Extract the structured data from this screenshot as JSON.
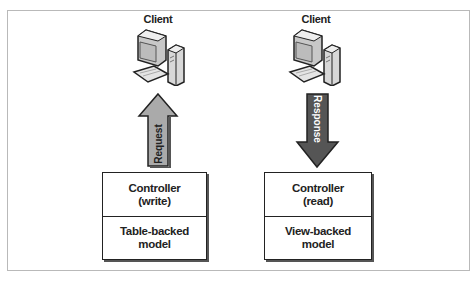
{
  "clients": [
    {
      "label": "Client",
      "icon": "desktop-computer-icon"
    },
    {
      "label": "Client",
      "icon": "desktop-computer-icon"
    }
  ],
  "arrows": [
    {
      "label": "Request",
      "direction": "up",
      "fill": "#aaaaaa"
    },
    {
      "label": "Response",
      "direction": "down",
      "fill": "#555555"
    }
  ],
  "components": [
    {
      "controller": "Controller\n(write)",
      "model": "Table-backed\nmodel"
    },
    {
      "controller": "Controller\n(read)",
      "model": "View-backed\nmodel"
    }
  ]
}
